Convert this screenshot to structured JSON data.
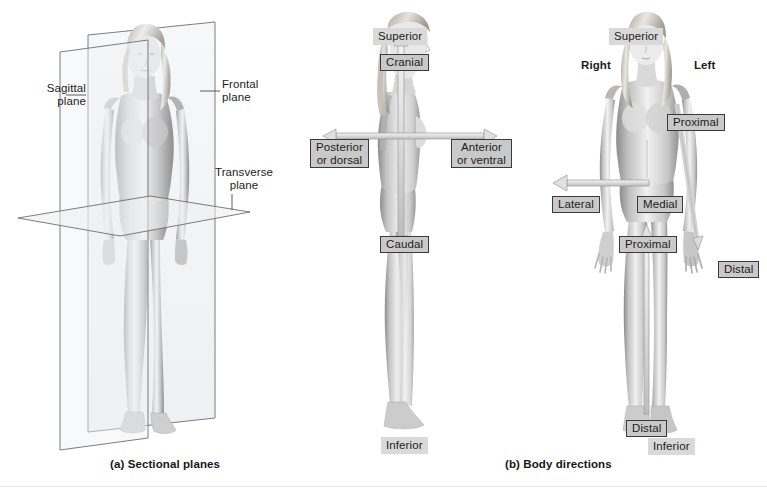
{
  "figure": {
    "title_a": "(a) Sectional planes",
    "title_b": "(b) Body directions"
  },
  "panel_a": {
    "name": "sectional-planes",
    "labels": {
      "sagittal_line1": "Sagittal",
      "sagittal_line2": "plane",
      "frontal_line1": "Frontal",
      "frontal_line2": "plane",
      "transverse_line1": "Transverse",
      "transverse_line2": "plane"
    }
  },
  "panel_b": {
    "name": "body-directions-lateral-view",
    "labels": {
      "superior": "Superior",
      "cranial": "Cranial",
      "posterior_line1": "Posterior",
      "posterior_line2": "or dorsal",
      "anterior_line1": "Anterior",
      "anterior_line2": "or ventral",
      "caudal": "Caudal",
      "inferior": "Inferior"
    }
  },
  "panel_c": {
    "name": "body-directions-anterior-view",
    "labels": {
      "superior": "Superior",
      "right": "Right",
      "left": "Left",
      "proximal_arm": "Proximal",
      "lateral": "Lateral",
      "medial": "Medial",
      "proximal_leg": "Proximal",
      "distal_arm": "Distal",
      "distal_leg": "Distal",
      "inferior": "Inferior"
    }
  },
  "colors": {
    "background": "#ffffff",
    "label_shaded_bg": "#d9d9d9",
    "label_boxed_bg": "#c9c9c9",
    "label_boxed_border": "#3a3a3a",
    "arrow_fill": "#d6d6d6",
    "arrow_stroke": "#8c8c8c",
    "plane_stroke": "#6e6e6e",
    "plane_fill": "#eceef0",
    "text": "#1c1c1c",
    "skin_light": "#efefef",
    "skin_mid": "#c6c6c6",
    "skin_dark": "#8f8f8f"
  }
}
